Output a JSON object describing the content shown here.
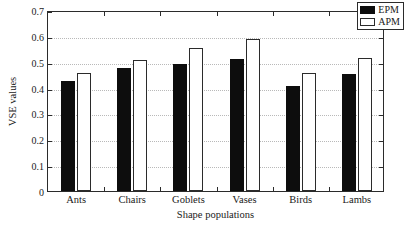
{
  "chart_data": {
    "type": "bar",
    "title": "",
    "xlabel": "Shape populations",
    "ylabel": "VSE values",
    "categories": [
      "Ants",
      "Chairs",
      "Goblets",
      "Vases",
      "Birds",
      "Lambs"
    ],
    "series": [
      {
        "name": "EPM",
        "color": "#0d0d0d",
        "values": [
          0.425,
          0.475,
          0.493,
          0.51,
          0.408,
          0.454
        ]
      },
      {
        "name": "APM",
        "color": "#ffffff",
        "values": [
          0.456,
          0.505,
          0.553,
          0.589,
          0.456,
          0.513
        ]
      }
    ],
    "ylim": [
      0,
      0.7
    ],
    "yticks": [
      0,
      0.1,
      0.2,
      0.3,
      0.4,
      0.5,
      0.6,
      0.7
    ],
    "ytick_labels": [
      "0",
      "0.1",
      "0.2",
      "0.3",
      "0.4",
      "0.5",
      "0.6",
      "0.7"
    ],
    "grid": true,
    "grid_axis": "y",
    "legend_position": "upper right",
    "legend_entries": [
      "EPM",
      "APM"
    ]
  },
  "axes": {
    "y_title": "VSE values",
    "x_title": "Shape populations"
  },
  "legend": {
    "entries": [
      {
        "label": "EPM",
        "swatch": "filled-black-swatch"
      },
      {
        "label": "APM",
        "swatch": "outlined-white-swatch"
      }
    ]
  }
}
